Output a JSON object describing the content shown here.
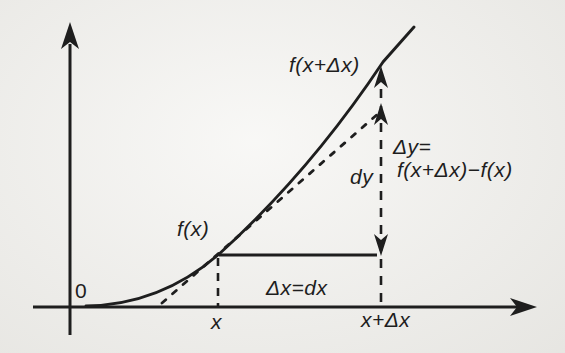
{
  "figure": {
    "colors": {
      "paper": "#f0efeb",
      "ink": "#1e1e1e"
    },
    "labels": {
      "origin": "0",
      "f_of_x": "f(x)",
      "f_of_x_plus_dx": "f(x+Δx)",
      "dy": "dy",
      "delta_y_eq": "Δy=",
      "delta_y_expansion": "f(x+Δx)−f(x)",
      "delta_x_eq": "Δx=dx",
      "x_tick": "x",
      "x_plus_dx_tick": "x+Δx"
    }
  }
}
